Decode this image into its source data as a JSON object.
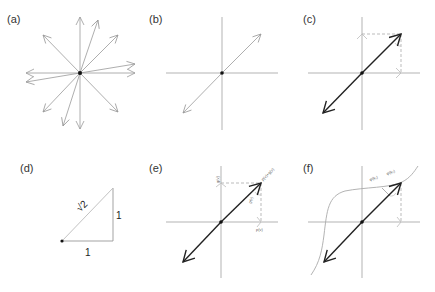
{
  "figure": {
    "panels": [
      {
        "id": "a",
        "label": "(a)",
        "description": "Many vectors radiating from origin"
      },
      {
        "id": "b",
        "label": "(b)",
        "description": "Single diagonal vector on axes"
      },
      {
        "id": "c",
        "label": "(c)",
        "description": "Bold diagonal vector with dashed projections onto axes"
      },
      {
        "id": "d",
        "label": "(d)",
        "description": "Right triangle with sides 1, 1 and hypotenuse sqrt 2"
      },
      {
        "id": "e",
        "label": "(e)",
        "description": "Bold vector decomposed into p(v) and g(v) components"
      },
      {
        "id": "f",
        "label": "(f)",
        "description": "Bold vector with nonlinear sigmoid curve"
      }
    ],
    "d_labels": {
      "hypotenuse": "√2",
      "side_vertical": "1",
      "side_horizontal": "1"
    },
    "e_labels": {
      "y_axis": "g(v)",
      "x_axis": "p(v)",
      "tip": "p(v)+g(v)",
      "diag": "g(v)"
    },
    "f_labels": {
      "label1": "φ(k₁)",
      "label2": "φ(k₂)"
    },
    "colors": {
      "axis": "#aaaaaa",
      "bold_vector": "#222222",
      "thin_vector": "#999999"
    }
  }
}
